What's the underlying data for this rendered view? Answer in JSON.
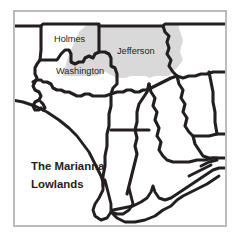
{
  "figure": {
    "kind": "reference-map",
    "title": "The Marianna Lowlands",
    "frame_color": "#b9bbbd",
    "background_color": "#ffffff",
    "line_color": "#231f20",
    "highlight_fill": "#d9d9d9"
  },
  "labels": {
    "holmes": "Holmes",
    "jefferson": "Jefferson",
    "washington": "Washington",
    "region_line1": "The Marianna",
    "region_line2": "Lowlands"
  },
  "counties": [
    {
      "name": "Holmes",
      "highlighted": "partial"
    },
    {
      "name": "Jefferson",
      "highlighted": "yes"
    },
    {
      "name": "Washington",
      "highlighted": "partial"
    }
  ],
  "region": {
    "name": "The Marianna Lowlands",
    "shading": "light gray wedge spanning from Holmes across Jefferson"
  },
  "icons": {
    "coastline": "coastline-line",
    "state_border": "state-border-line",
    "county_border": "county-border-line"
  }
}
